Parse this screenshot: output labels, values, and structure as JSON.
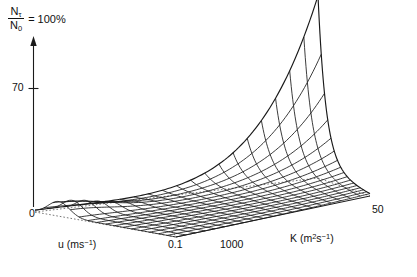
{
  "figure": {
    "type": "3d-wireframe-surface",
    "vertical_axis": {
      "numerator": "N",
      "numerator_sub": "τ",
      "denominator": "N",
      "denominator_sub": "0",
      "equals_label": "= 100%",
      "tick_labels": [
        "70"
      ],
      "origin_label": "0"
    },
    "left_axis": {
      "label": "u (ms",
      "label_sup": "−1",
      "label_tail": ")",
      "start_label": "0",
      "end_label": "0.1"
    },
    "right_axis": {
      "label": "K (m",
      "label_sup1": "2",
      "label_mid": "s",
      "label_sup2": "−1",
      "label_tail": ")",
      "start_label": "1000",
      "end_label": "50"
    },
    "colors": {
      "line": "#1a1a1a",
      "background": "#ffffff",
      "dashed": "#555555"
    }
  },
  "chart_data": {
    "type": "surface",
    "title": "",
    "xlabel": "u (ms^-1)",
    "ylabel": "K (m^2 s^-1)",
    "zlabel": "N_tau / N_0 = 100%",
    "grid": false,
    "legend": "none",
    "x": {
      "name": "u",
      "unit": "ms^-1",
      "min": 0,
      "max": 0.1,
      "ticks": [
        0,
        0.1
      ],
      "n": 17
    },
    "y": {
      "name": "K",
      "unit": "m^2 s^-1",
      "min": 1000,
      "max": 50,
      "ticks": [
        1000,
        50
      ],
      "n": 21
    },
    "z": {
      "name": "N_tau/N_0",
      "unit": "%",
      "min": 0,
      "max": 100,
      "ticks": [
        0,
        70
      ]
    },
    "peak": {
      "u": 0.0,
      "K": 50,
      "z": 100
    },
    "z_surface_note": "z(u,K) grows as both u and K decrease; maximum z=100 at (u=0, K=50); z<5 for most of the interior.",
    "wire_counts": {
      "u_lines": 17,
      "K_lines": 21
    }
  }
}
